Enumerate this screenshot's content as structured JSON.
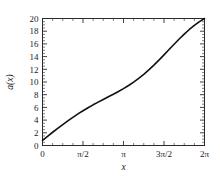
{
  "chart_data": {
    "type": "line",
    "title": "",
    "xlabel": "x",
    "ylabel": "a(x)",
    "xlim": [
      0,
      6.283185307179586
    ],
    "ylim": [
      0,
      20
    ],
    "grid": false,
    "legend": null,
    "x_tick_labels": [
      "0",
      "π/2",
      "π",
      "3π/2",
      "2π"
    ],
    "x_tick_values": [
      0,
      1.5707963,
      3.1415927,
      4.712389,
      6.2831853
    ],
    "y_tick_labels": [
      "0",
      "2",
      "4",
      "6",
      "8",
      "10",
      "12",
      "14",
      "16",
      "18",
      "20"
    ],
    "y_tick_values": [
      0,
      2,
      4,
      6,
      8,
      10,
      12,
      14,
      16,
      18,
      20
    ],
    "y_minor_step": 0.5,
    "x_minor_step": 0.3926991,
    "series": [
      {
        "name": "a(x)",
        "color": "#111111",
        "x": [
          0.0,
          0.1963495,
          0.3926991,
          0.5890486,
          0.7853982,
          0.9817477,
          1.1780972,
          1.3744468,
          1.5707963,
          1.7671459,
          1.9634954,
          2.1598449,
          2.3561945,
          2.552544,
          2.7488936,
          2.9452431,
          3.1415927,
          3.3379422,
          3.5342917,
          3.7306413,
          3.9269908,
          4.1233404,
          4.3196899,
          4.5160395,
          4.712389,
          4.9087385,
          5.1050881,
          5.3014376,
          5.4977871,
          5.6941367,
          5.8904862,
          6.0868358,
          6.2831853
        ],
        "y": [
          1.0,
          1.78,
          2.56,
          3.31,
          4.05,
          4.76,
          5.45,
          6.1,
          6.71,
          7.3,
          7.86,
          8.39,
          8.9,
          9.41,
          9.91,
          10.43,
          10.99,
          11.59,
          12.24,
          12.96,
          13.75,
          14.61,
          15.53,
          16.5,
          17.51,
          18.54,
          19.57,
          20.57,
          21.53,
          22.42,
          23.23,
          23.94,
          24.54
        ]
      }
    ]
  },
  "figure": {
    "axis_color": "#2b2b2b",
    "curve_color": "#111111",
    "background": "#ffffff"
  }
}
